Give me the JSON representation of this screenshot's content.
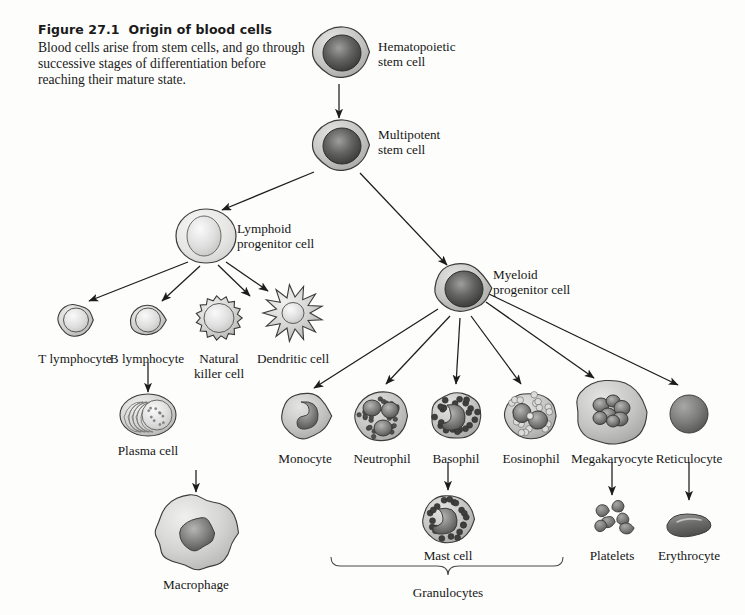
{
  "figure": {
    "number": "Figure 27.1",
    "title": "Origin of blood cells",
    "body": "Blood cells arise from stem cells, and go through successive stages of differentiation before reaching their mature state."
  },
  "colors": {
    "background": "#fdfdfc",
    "cytoplasm_light": "#e3e3e1",
    "cytoplasm_mid": "#c6c6c4",
    "cytoplasm_dark": "#a9a9a7",
    "nucleus_dark": "#4a4a4a",
    "nucleus_mid": "#6f6f6f",
    "nucleus_light": "#b9b9b7",
    "outline": "#3b3b3b",
    "arrow": "#1c1c1c",
    "text": "#161616"
  },
  "nodes": [
    {
      "id": "hematopoietic_stem_cell",
      "label": "Hematopoietic\nstem cell",
      "label_x": 378,
      "label_y": 40,
      "align": "lft",
      "cell_x": 339,
      "cell_y": 52,
      "kind": "blast"
    },
    {
      "id": "multipotent_stem_cell",
      "label": "Multipotent\nstem cell",
      "label_x": 378,
      "label_y": 128,
      "align": "lft",
      "cell_x": 339,
      "cell_y": 145,
      "kind": "blast"
    },
    {
      "id": "lymphoid_progenitor_cell",
      "label": "Lymphoid\nprogenitor cell",
      "label_x": 237,
      "label_y": 222,
      "align": "lft",
      "cell_x": 206,
      "cell_y": 236,
      "kind": "pale-round"
    },
    {
      "id": "myeloid_progenitor_cell",
      "label": "Myeloid\nprogenitor cell",
      "label_x": 493,
      "label_y": 268,
      "align": "lft",
      "cell_x": 461,
      "cell_y": 288,
      "kind": "blast"
    },
    {
      "id": "t_lymphocyte",
      "label": "T lymphocyte",
      "label_x": 75,
      "label_y": 352,
      "align": "ctr",
      "cell_x": 75,
      "cell_y": 320,
      "kind": "lymphocyte"
    },
    {
      "id": "b_lymphocyte",
      "label": "B lymphocyte",
      "label_x": 147,
      "label_y": 352,
      "align": "ctr",
      "cell_x": 147,
      "cell_y": 320,
      "kind": "lymphocyte"
    },
    {
      "id": "natural_killer_cell",
      "label": "Natural\nkiller cell",
      "label_x": 219,
      "label_y": 352,
      "align": "ctr",
      "cell_x": 219,
      "cell_y": 318,
      "kind": "nk"
    },
    {
      "id": "dendritic_cell",
      "label": "Dendritic cell",
      "label_x": 293,
      "label_y": 352,
      "align": "ctr",
      "cell_x": 293,
      "cell_y": 313,
      "kind": "dendritic"
    },
    {
      "id": "plasma_cell",
      "label": "Plasma cell",
      "label_x": 148,
      "label_y": 444,
      "align": "ctr",
      "cell_x": 148,
      "cell_y": 415,
      "kind": "plasma"
    },
    {
      "id": "monocyte",
      "label": "Monocyte",
      "label_x": 305,
      "label_y": 452,
      "align": "ctr",
      "cell_x": 305,
      "cell_y": 416,
      "kind": "monocyte"
    },
    {
      "id": "neutrophil",
      "label": "Neutrophil",
      "label_x": 382,
      "label_y": 452,
      "align": "ctr",
      "cell_x": 381,
      "cell_y": 416,
      "kind": "neutrophil"
    },
    {
      "id": "basophil",
      "label": "Basophil",
      "label_x": 456,
      "label_y": 452,
      "align": "ctr",
      "cell_x": 456,
      "cell_y": 416,
      "kind": "basophil"
    },
    {
      "id": "eosinophil",
      "label": "Eosinophil",
      "label_x": 531,
      "label_y": 452,
      "align": "ctr",
      "cell_x": 530,
      "cell_y": 416,
      "kind": "eosinophil"
    },
    {
      "id": "megakaryocyte",
      "label": "Megakaryocyte",
      "label_x": 612,
      "label_y": 452,
      "align": "ctr",
      "cell_x": 612,
      "cell_y": 412,
      "kind": "megakaryocyte"
    },
    {
      "id": "reticulocyte",
      "label": "Reticulocyte",
      "label_x": 689,
      "label_y": 452,
      "align": "ctr",
      "cell_x": 689,
      "cell_y": 414,
      "kind": "reticulocyte"
    },
    {
      "id": "macrophage",
      "label": "Macrophage",
      "label_x": 196,
      "label_y": 578,
      "align": "ctr",
      "cell_x": 196,
      "cell_y": 533,
      "kind": "macrophage"
    },
    {
      "id": "mast_cell",
      "label": "Mast cell",
      "label_x": 448,
      "label_y": 549,
      "align": "ctr",
      "cell_x": 448,
      "cell_y": 519,
      "kind": "mast"
    },
    {
      "id": "platelets",
      "label": "Platelets",
      "label_x": 612,
      "label_y": 549,
      "align": "ctr",
      "cell_x": 612,
      "cell_y": 519,
      "kind": "platelets"
    },
    {
      "id": "erythrocyte",
      "label": "Erythrocyte",
      "label_x": 689,
      "label_y": 549,
      "align": "ctr",
      "cell_x": 689,
      "cell_y": 524,
      "kind": "erythrocyte"
    }
  ],
  "bracket": {
    "label": "Granulocytes",
    "label_x": 448,
    "label_y": 586,
    "left_x": 331,
    "right_x": 563,
    "y": 566
  },
  "arrows": [
    {
      "id": "hsc-to-mpp",
      "from": "hematopoietic_stem_cell",
      "to": "multipotent_stem_cell",
      "x1": 339,
      "y1": 84,
      "x2": 339,
      "y2": 118
    },
    {
      "id": "mpp-to-lymphoid",
      "from": "multipotent_stem_cell",
      "to": "lymphoid_progenitor_cell",
      "x1": 314,
      "y1": 172,
      "x2": 222,
      "y2": 210
    },
    {
      "id": "mpp-to-myeloid",
      "from": "multipotent_stem_cell",
      "to": "myeloid_progenitor_cell",
      "x1": 360,
      "y1": 173,
      "x2": 447,
      "y2": 265
    },
    {
      "id": "lymphoid-to-t",
      "from": "lymphoid_progenitor_cell",
      "to": "t_lymphocyte",
      "x1": 188,
      "y1": 262,
      "x2": 89,
      "y2": 301
    },
    {
      "id": "lymphoid-to-b",
      "from": "lymphoid_progenitor_cell",
      "to": "b_lymphocyte",
      "x1": 200,
      "y1": 266,
      "x2": 162,
      "y2": 301
    },
    {
      "id": "lymphoid-to-nk",
      "from": "lymphoid_progenitor_cell",
      "to": "natural_killer_cell",
      "x1": 218,
      "y1": 265,
      "x2": 250,
      "y2": 296
    },
    {
      "id": "lymphoid-to-dendritic",
      "from": "lymphoid_progenitor_cell",
      "to": "dendritic_cell",
      "x1": 226,
      "y1": 262,
      "x2": 268,
      "y2": 291
    },
    {
      "id": "b-to-plasma",
      "from": "b_lymphocyte",
      "to": "plasma_cell",
      "x1": 148,
      "y1": 362,
      "x2": 148,
      "y2": 392
    },
    {
      "id": "myeloid-to-monocyte",
      "from": "myeloid_progenitor_cell",
      "to": "monocyte",
      "x1": 438,
      "y1": 309,
      "x2": 314,
      "y2": 388
    },
    {
      "id": "myeloid-to-neutrophil",
      "from": "myeloid_progenitor_cell",
      "to": "neutrophil",
      "x1": 450,
      "y1": 316,
      "x2": 386,
      "y2": 384
    },
    {
      "id": "myeloid-to-basophil",
      "from": "myeloid_progenitor_cell",
      "to": "basophil",
      "x1": 460,
      "y1": 318,
      "x2": 456,
      "y2": 384
    },
    {
      "id": "myeloid-to-eosinophil",
      "from": "myeloid_progenitor_cell",
      "to": "eosinophil",
      "x1": 471,
      "y1": 316,
      "x2": 521,
      "y2": 384
    },
    {
      "id": "myeloid-to-megakaryocyte",
      "from": "myeloid_progenitor_cell",
      "to": "megakaryocyte",
      "x1": 486,
      "y1": 302,
      "x2": 594,
      "y2": 378
    },
    {
      "id": "myeloid-to-reticulocyte",
      "from": "myeloid_progenitor_cell",
      "to": "reticulocyte",
      "x1": 489,
      "y1": 294,
      "x2": 678,
      "y2": 385
    },
    {
      "id": "monocyte-to-macrophage",
      "from": "monocyte",
      "to": "macrophage",
      "x1": 196,
      "y1": 470,
      "x2": 196,
      "y2": 492
    },
    {
      "id": "basophil-to-mast",
      "from": "basophil",
      "to": "mast_cell",
      "x1": 448,
      "y1": 462,
      "x2": 448,
      "y2": 490
    },
    {
      "id": "megakaryocyte-to-platelets",
      "from": "megakaryocyte",
      "to": "platelets",
      "x1": 612,
      "y1": 462,
      "x2": 612,
      "y2": 495
    },
    {
      "id": "reticulocyte-to-erythrocyte",
      "from": "reticulocyte",
      "to": "erythrocyte",
      "x1": 689,
      "y1": 462,
      "x2": 689,
      "y2": 500
    }
  ]
}
